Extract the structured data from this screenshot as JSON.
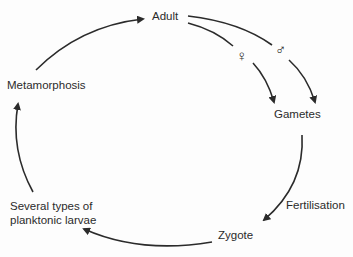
{
  "diagram": {
    "type": "life-cycle",
    "nodes": {
      "adult": "Adult",
      "gametes": "Gametes",
      "zygote": "Zygote",
      "larvae_line1": "Several types of",
      "larvae_line2": "planktonic larvae",
      "metamorphosis": "Metamorphosis"
    },
    "edge_labels": {
      "fertilisation": "Fertilisation"
    },
    "symbols": {
      "female": "♀",
      "male": "♂"
    },
    "edges": [
      {
        "from": "Metamorphosis",
        "to": "Adult"
      },
      {
        "from": "Adult",
        "to": "Gametes",
        "via": "female"
      },
      {
        "from": "Adult",
        "to": "Gametes",
        "via": "male"
      },
      {
        "from": "Gametes",
        "to": "Zygote",
        "label": "Fertilisation"
      },
      {
        "from": "Zygote",
        "to": "Several types of planktonic larvae"
      },
      {
        "from": "Several types of planktonic larvae",
        "to": "Metamorphosis"
      }
    ],
    "colors": {
      "line": "#2b2b2b",
      "background": "#fdfdfd"
    }
  }
}
